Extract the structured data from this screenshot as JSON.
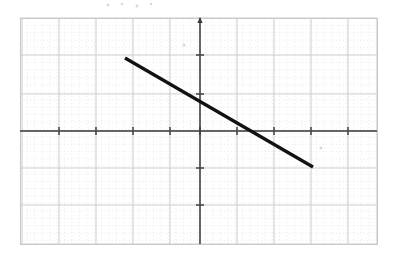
{
  "figure": {
    "kind": "hand-drawn-graph-scan",
    "width": 395,
    "height": 261,
    "background_color": "#ffffff",
    "title": "",
    "caption": ""
  },
  "grid": {
    "frame": {
      "left": 20,
      "top": 18,
      "right": 377,
      "bottom": 244
    },
    "border_color": "#c9c9c9",
    "minor": {
      "spacing_px": 7.42,
      "color": "#e6e6e6",
      "style": "dotted",
      "visible": true
    },
    "major": {
      "cells_per_major": 5,
      "spacing_px": 37.1,
      "color": "#d0d0d0",
      "style": "solid",
      "visible": true
    },
    "major_x_positions": [
      22,
      59,
      96,
      133,
      170,
      200,
      237,
      274,
      311,
      348,
      377
    ],
    "major_y_positions": [
      18,
      55,
      94,
      131,
      168,
      205,
      244
    ]
  },
  "axes": {
    "x_axis": {
      "label": "",
      "y_pixel": 131,
      "color": "#3a3a3a",
      "from_px": 20,
      "to_px": 377,
      "arrow_right": false,
      "tick_count": 10,
      "tick_color": "#4a4a4a",
      "tick_half_length": 4
    },
    "y_axis": {
      "label": "",
      "x_pixel": 200,
      "color": "#3a3a3a",
      "from_px": 18,
      "to_px": 244,
      "arrow_up": true,
      "tick_count": 6,
      "tick_color": "#4a4a4a",
      "tick_half_length": 4
    },
    "origin": {
      "x": 200,
      "y": 131
    }
  },
  "chart_data": {
    "type": "line",
    "title": "",
    "subtitle": "",
    "xlabel": "",
    "ylabel": "",
    "grid": true,
    "legend": "none",
    "xlim": [
      -4.8,
      4.8
    ],
    "ylim": [
      -3.05,
      3.05
    ],
    "unit_px": 37.1,
    "series": [
      {
        "name": "segment",
        "color": "#121212",
        "line_width_px": 3.2,
        "endpoints_px": [
          {
            "x": 125,
            "y": 58
          },
          {
            "x": 313,
            "y": 167
          }
        ],
        "x": [
          -2.02,
          3.05
        ],
        "y": [
          1.97,
          -0.97
        ],
        "slope": -0.58,
        "y_intercept": 0.8,
        "x_intercept": 1.57,
        "closed": false
      }
    ]
  },
  "artifacts": {
    "description": "faint scan speckles on the paper",
    "color": "#d8d8d8",
    "marks": [
      {
        "x": 184,
        "y": 45,
        "r": 1.6
      },
      {
        "x": 321,
        "y": 148,
        "r": 1.5
      },
      {
        "x": 108,
        "y": 5,
        "r": 1.4
      },
      {
        "x": 122,
        "y": 4,
        "r": 1.3
      },
      {
        "x": 137,
        "y": 6,
        "r": 1.5
      },
      {
        "x": 151,
        "y": 4,
        "r": 1.2
      }
    ]
  }
}
